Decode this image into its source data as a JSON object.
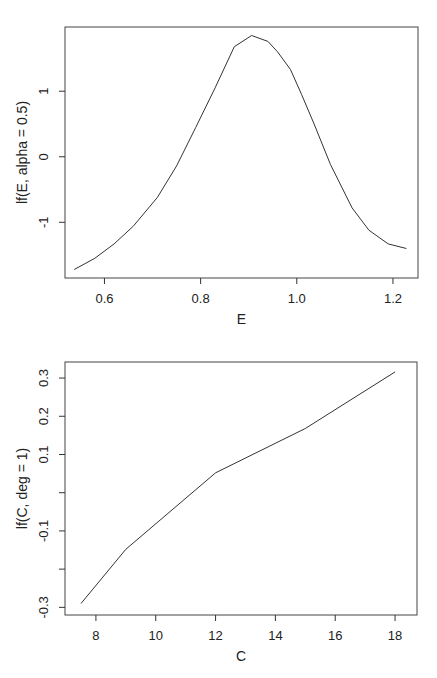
{
  "chart_data": [
    {
      "type": "line",
      "title": "",
      "xlabel": "E",
      "ylabel": "lf(E, alpha = 0.5)",
      "xlim": [
        0.52,
        1.25
      ],
      "ylim": [
        -1.85,
        1.98
      ],
      "xticks": [
        0.6,
        0.8,
        1.0,
        1.2
      ],
      "xtick_labels": [
        "0.6",
        "0.8",
        "1.0",
        "1.2"
      ],
      "yticks": [
        -1,
        0,
        1
      ],
      "ytick_labels": [
        "-1",
        "0",
        "1"
      ],
      "grid": false,
      "legend": null,
      "series": [
        {
          "name": "lf(E, alpha = 0.5)",
          "x": [
            0.537,
            0.58,
            0.62,
            0.66,
            0.71,
            0.75,
            0.79,
            0.83,
            0.87,
            0.906,
            0.94,
            0.96,
            0.987,
            1.01,
            1.036,
            1.07,
            1.115,
            1.15,
            1.19,
            1.228
          ],
          "y": [
            -1.72,
            -1.55,
            -1.33,
            -1.06,
            -0.62,
            -0.14,
            0.45,
            1.05,
            1.68,
            1.85,
            1.76,
            1.6,
            1.33,
            0.95,
            0.5,
            -0.12,
            -0.78,
            -1.12,
            -1.33,
            -1.4
          ]
        }
      ]
    },
    {
      "type": "line",
      "title": "",
      "xlabel": "C",
      "ylabel": "lf(C, deg = 1)",
      "xlim": [
        7.0,
        18.7
      ],
      "ylim": [
        -0.32,
        0.342
      ],
      "xticks": [
        8,
        10,
        12,
        14,
        16,
        18
      ],
      "xtick_labels": [
        "8",
        "10",
        "12",
        "14",
        "16",
        "18"
      ],
      "yticks": [
        -0.3,
        -0.2,
        -0.1,
        0.0,
        0.1,
        0.2,
        0.3
      ],
      "ytick_labels": [
        "-0.3",
        "",
        "-0.1",
        "",
        "0.1",
        "0.2",
        "0.3"
      ],
      "grid": false,
      "legend": null,
      "series": [
        {
          "name": "lf(C, deg = 1)",
          "x": [
            7.5,
            9.0,
            12.0,
            15.0,
            18.0
          ],
          "y": [
            -0.29,
            -0.148,
            0.052,
            0.168,
            0.316
          ]
        }
      ]
    }
  ],
  "layout": {
    "plots": [
      {
        "left": 65,
        "right": 418,
        "top": 27,
        "bottom": 278,
        "xlabel_y": 298,
        "ylabel_x": 27
      },
      {
        "left": 65,
        "right": 417,
        "top": 362,
        "bottom": 615,
        "xlabel_y": 633,
        "ylabel_x": 27
      }
    ]
  }
}
